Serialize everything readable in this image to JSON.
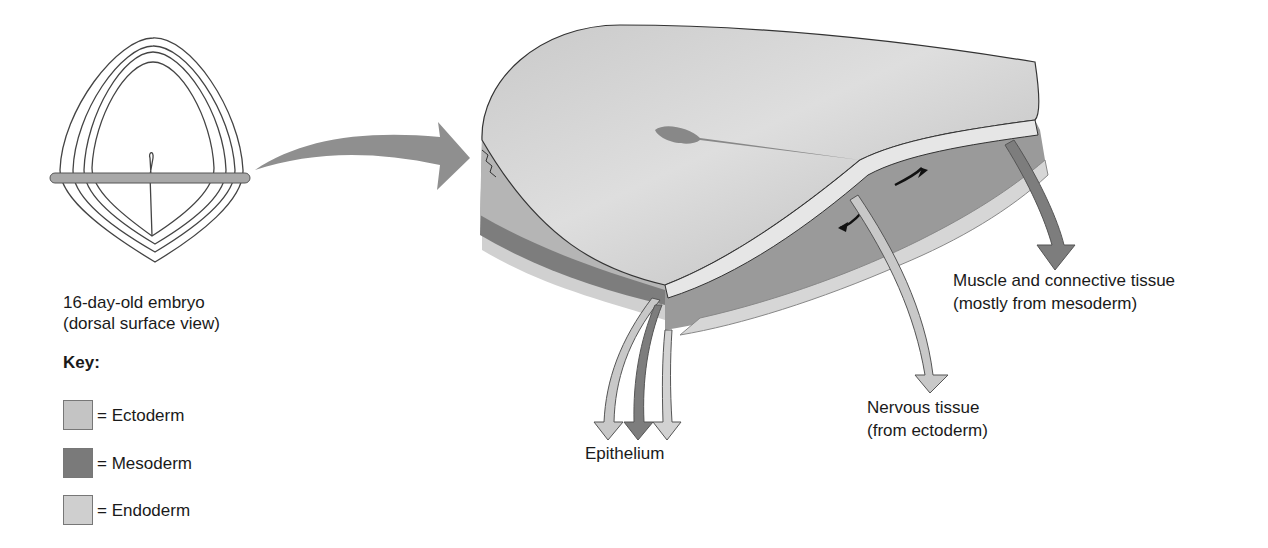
{
  "embryo_caption": {
    "line1": "16-day-old embryo",
    "line2": "(dorsal surface view)"
  },
  "key": {
    "title": "Key:",
    "items": [
      {
        "label": "= Ectoderm",
        "color": "#c4c4c4"
      },
      {
        "label": "= Mesoderm",
        "color": "#7a7a7a"
      },
      {
        "label": "= Endoderm",
        "color": "#cfcfcf"
      }
    ]
  },
  "labels": {
    "muscle": {
      "line1": "Muscle and connective tissue",
      "line2": "(mostly from mesoderm)"
    },
    "nervous": {
      "line1": "Nervous tissue",
      "line2": "(from ectoderm)"
    },
    "epithelium": "Epithelium"
  },
  "colors": {
    "ectoderm": "#bdbdbd",
    "mesoderm": "#7d7d7d",
    "endoderm": "#d2d2d2",
    "arrow_big": "#8c8c8c",
    "outline": "#333333"
  }
}
